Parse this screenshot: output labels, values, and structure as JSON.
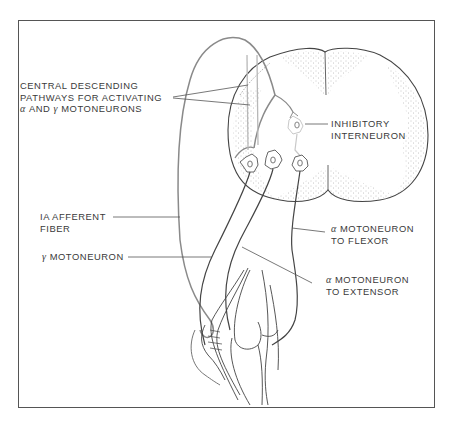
{
  "figure": {
    "type": "anatomical-diagram"
  },
  "labels": {
    "central_descending": {
      "line1": "CENTRAL DESCENDING",
      "line2": "PATHWAYS FOR ACTIVATING",
      "line3_greek_a": "α",
      "line3_mid": "AND",
      "line3_greek_g": "γ",
      "line3_end": "MOTONEURONS"
    },
    "inhibitory_interneuron": {
      "line1": "INHIBITORY",
      "line2": "INTERNEURON"
    },
    "ia_afferent": {
      "line1": "IA AFFERENT",
      "line2": "FIBER"
    },
    "gamma_motoneuron": {
      "greek": "γ",
      "text": "MOTONEURON"
    },
    "alpha_flexor": {
      "greek": "α",
      "line1": "MOTONEURON",
      "line2": "TO FLEXOR"
    },
    "alpha_extensor": {
      "greek": "α",
      "line1": "MOTONEURON",
      "line2": "TO EXTENSOR"
    }
  },
  "colors": {
    "ink": "#3a3a3a",
    "afferent_fiber": "#8a8a8a",
    "descending_pathway": "#b8b8b8",
    "stipple": "#8c8c8c",
    "frame": "#555555"
  }
}
